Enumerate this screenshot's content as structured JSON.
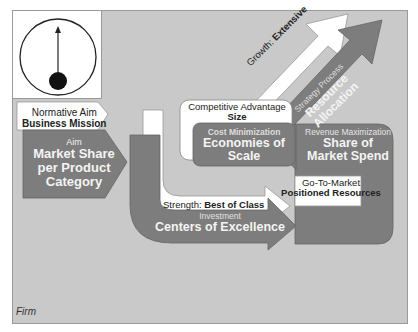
{
  "gauge": {
    "icon": "gauge-needle-icon"
  },
  "normative": {
    "label": "Normative Aim",
    "value": "Business Mission"
  },
  "aim": {
    "label": "Aim",
    "line1": "Market Share",
    "line2": "per Product",
    "line3": "Category"
  },
  "competitive": {
    "label": "Competitive Advantage",
    "value": "Size"
  },
  "cost": {
    "label": "Cost Minimization",
    "line1": "Economies of",
    "line2": "Scale"
  },
  "growth": {
    "label": "Growth:",
    "value": "Extensive"
  },
  "strategy": {
    "label": "Strategy Process",
    "line1": "Resource",
    "line2": "Allocation"
  },
  "revenue": {
    "label": "Revenue Maximization",
    "line1": "Share of",
    "line2": "Market Spend"
  },
  "gotomarket": {
    "label": "Go-To-Market",
    "value": "Positioned Resources"
  },
  "strength": {
    "label": "Strength:",
    "value": "Best of Class"
  },
  "investment": {
    "label": "Investment",
    "value": "Centers of Excellence"
  },
  "footer": {
    "label": "Firm"
  },
  "colors": {
    "background": "#c9c9c9",
    "shape": "#7d7d7d",
    "white": "#ffffff",
    "border": "#9a9a9a"
  }
}
